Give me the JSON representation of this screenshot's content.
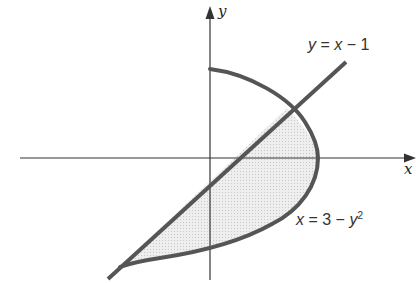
{
  "figure": {
    "axes": {
      "x_label": "x",
      "y_label": "y"
    },
    "curves": [
      {
        "name": "line",
        "label_lhs": "y",
        "label_rhs_var": "x",
        "label_rhs_rest": " − 1",
        "equals": " = "
      },
      {
        "name": "parabola",
        "label_lhs": "x",
        "label_rhs_num": " = 3 − ",
        "label_rhs_var": "y",
        "label_rhs_exp": "2"
      }
    ],
    "colors": {
      "curve": "#555555",
      "axis": "#333333",
      "fill": "#e6e6e6"
    }
  }
}
